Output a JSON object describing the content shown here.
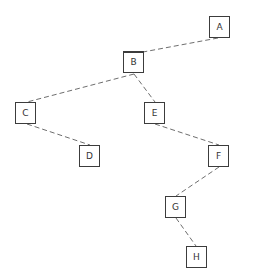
{
  "diagram": {
    "type": "tree",
    "nodes": [
      {
        "id": "A",
        "label": "A",
        "x": 209,
        "y": 16
      },
      {
        "id": "B",
        "label": "B",
        "x": 123,
        "y": 51
      },
      {
        "id": "C",
        "label": "C",
        "x": 15,
        "y": 102
      },
      {
        "id": "E",
        "label": "E",
        "x": 144,
        "y": 102
      },
      {
        "id": "D",
        "label": "D",
        "x": 79,
        "y": 145
      },
      {
        "id": "F",
        "label": "F",
        "x": 208,
        "y": 145
      },
      {
        "id": "G",
        "label": "G",
        "x": 165,
        "y": 196
      },
      {
        "id": "H",
        "label": "H",
        "x": 186,
        "y": 246
      }
    ],
    "edges": [
      {
        "from": "A",
        "to": "B",
        "x1": 218,
        "y1": 38,
        "x2": 143,
        "y2": 52
      },
      {
        "from": "B",
        "to": "C",
        "x1": 134,
        "y1": 74,
        "x2": 27,
        "y2": 102
      },
      {
        "from": "B",
        "to": "E",
        "x1": 134,
        "y1": 74,
        "x2": 155,
        "y2": 102
      },
      {
        "from": "C",
        "to": "D",
        "x1": 27,
        "y1": 124,
        "x2": 90,
        "y2": 145
      },
      {
        "from": "E",
        "to": "F",
        "x1": 155,
        "y1": 124,
        "x2": 219,
        "y2": 145
      },
      {
        "from": "F",
        "to": "G",
        "x1": 219,
        "y1": 167,
        "x2": 176,
        "y2": 196
      },
      {
        "from": "G",
        "to": "H",
        "x1": 176,
        "y1": 218,
        "x2": 196,
        "y2": 246
      }
    ],
    "colors": {
      "edge": "#6e6e6e",
      "node_border": "#3c3c3c",
      "node_fill": "#ffffff",
      "label": "#333333"
    }
  }
}
